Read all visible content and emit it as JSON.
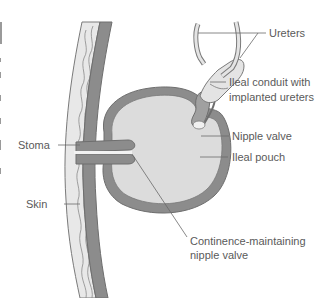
{
  "diagram": {
    "title": "",
    "colors": {
      "tissue_dark": "#8c8c8c",
      "tissue_mid": "#a8a8a8",
      "pouch_fill": "#dcdcdc",
      "skin_fill": "#e6e6e6",
      "line": "#6a6a6a",
      "text": "#5a5a5a"
    },
    "labels": {
      "ureters": "Ureters",
      "ileal_conduit_line1": "Ileal conduit with",
      "ileal_conduit_line2": "implanted ureters",
      "nipple_valve": "Nipple valve",
      "ileal_pouch": "Ileal pouch",
      "stoma": "Stoma",
      "skin": "Skin",
      "continence_line1": "Continence-maintaining",
      "continence_line2": "nipple valve"
    }
  }
}
